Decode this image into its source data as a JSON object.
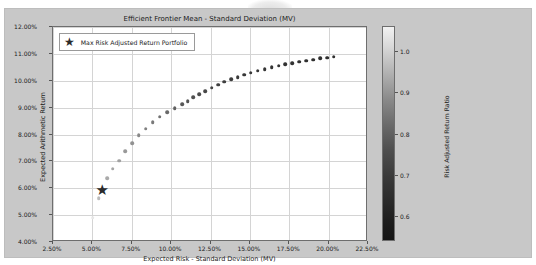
{
  "chart_data": {
    "type": "scatter",
    "title": "Efficient Frontier Mean - Standard Deviation (MV)",
    "xlabel": "Expected Risk - Standard Deviation (MV)",
    "ylabel": "Expected Arithmetic Return",
    "xlim": [
      2.5,
      22.5
    ],
    "ylim": [
      4.0,
      12.0
    ],
    "grid": true,
    "xticks": [
      "2.50%",
      "5.00%",
      "7.50%",
      "10.00%",
      "12.50%",
      "15.00%",
      "17.50%",
      "20.00%",
      "22.50%"
    ],
    "xtick_values": [
      2.5,
      5.0,
      7.5,
      10.0,
      12.5,
      15.0,
      17.5,
      20.0,
      22.5
    ],
    "yticks": [
      "4.00%",
      "5.00%",
      "6.00%",
      "7.00%",
      "8.00%",
      "9.00%",
      "10.00%",
      "11.00%",
      "12.00%"
    ],
    "ytick_values": [
      4.0,
      5.0,
      6.0,
      7.0,
      8.0,
      9.0,
      10.0,
      11.0,
      12.0
    ],
    "legend": {
      "position": "upper left",
      "entries": [
        {
          "label": "Max Risk Adjusted Return Portfolio",
          "marker": "star",
          "color": "#2b2b2b"
        }
      ]
    },
    "colorbar": {
      "label": "Risk Adjusted Return Ratio",
      "ticks": [
        "1.0",
        "0.9",
        "0.8",
        "0.7",
        "0.6"
      ],
      "tick_values": [
        1.0,
        0.9,
        0.8,
        0.7,
        0.6
      ],
      "vmin": 0.54,
      "vmax": 1.06,
      "orientation": "vertical",
      "colormap": "gray_r-inverted",
      "high_color": "#f2f2f2",
      "low_color": "#151515"
    },
    "series": [
      {
        "name": "Efficient Frontier Portfolios",
        "x": [
          5.02,
          5.4,
          5.62,
          5.95,
          6.3,
          6.7,
          7.1,
          7.52,
          7.95,
          8.38,
          8.82,
          9.28,
          9.75,
          10.22,
          10.7,
          11.05,
          11.42,
          11.8,
          12.18,
          12.58,
          12.98,
          13.38,
          13.8,
          14.22,
          14.64,
          15.06,
          15.5,
          15.94,
          16.38,
          16.82,
          17.26,
          17.7,
          18.14,
          18.58,
          19.02,
          19.46,
          19.9,
          20.32
        ],
        "y": [
          4.9,
          5.62,
          5.95,
          6.38,
          6.72,
          7.02,
          7.38,
          7.68,
          7.98,
          8.22,
          8.46,
          8.66,
          8.82,
          8.98,
          9.12,
          9.24,
          9.38,
          9.5,
          9.62,
          9.74,
          9.86,
          9.96,
          10.06,
          10.14,
          10.22,
          10.3,
          10.38,
          10.44,
          10.5,
          10.56,
          10.62,
          10.66,
          10.71,
          10.75,
          10.79,
          10.83,
          10.86,
          10.9
        ],
        "c": [
          0.55,
          0.66,
          0.68,
          0.7,
          0.71,
          0.72,
          0.74,
          0.76,
          0.78,
          0.8,
          0.82,
          0.84,
          0.86,
          0.88,
          0.9,
          0.91,
          0.92,
          0.93,
          0.94,
          0.95,
          0.96,
          0.965,
          0.97,
          0.975,
          0.98,
          0.982,
          0.985,
          0.987,
          0.99,
          0.992,
          0.994,
          0.995,
          0.996,
          0.997,
          0.998,
          0.999,
          1.0,
          1.0
        ]
      }
    ],
    "highlight_point": {
      "label": "Max Risk Adjusted Return Portfolio",
      "x": 5.62,
      "y": 5.95
    }
  }
}
